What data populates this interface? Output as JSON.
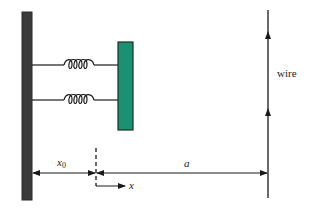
{
  "diagram": {
    "labels": {
      "wire": "wire",
      "x0": "x",
      "x0_sub": "0",
      "a": "a",
      "x_axis": "x"
    },
    "colors": {
      "wall": "#3a3a3a",
      "block": "#1a9272",
      "block_outline": "#1e2a26",
      "lines": "#1a1a1a"
    },
    "components": {
      "wall": {
        "shape": "vertical bar"
      },
      "springs": [
        {
          "position": "upper"
        },
        {
          "position": "lower"
        }
      ],
      "block": {
        "shape": "rectangle"
      },
      "wire": {
        "current_direction": "up",
        "arrow_count": 2
      },
      "dimensions": [
        {
          "name": "x0",
          "from": "wall",
          "to": "equilibrium line"
        },
        {
          "name": "a",
          "from": "equilibrium line",
          "to": "wire"
        }
      ],
      "axis": {
        "name": "x",
        "direction": "right"
      }
    }
  }
}
